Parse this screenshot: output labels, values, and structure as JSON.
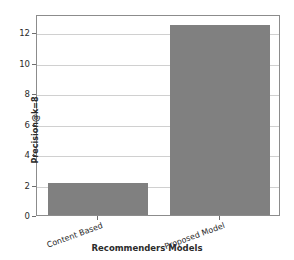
{
  "chart_data": {
    "type": "bar",
    "title": "",
    "xlabel": "Recommenders Models",
    "ylabel": "Precision@k=8",
    "categories": [
      "Content Based",
      "Proposed Model"
    ],
    "values": [
      2.1,
      12.5
    ],
    "series": [
      {
        "name": "Precision@k=8",
        "values": [
          2.1,
          12.5
        ],
        "color": "#808080"
      }
    ],
    "ylim": [
      0,
      13.2
    ],
    "yticks": [
      0,
      2,
      4,
      6,
      8,
      10,
      12
    ],
    "ytick_labels": [
      "0",
      "2",
      "4",
      "6",
      "8",
      "10",
      "12"
    ],
    "grid": "horizontal",
    "legend": "none",
    "bar_color": "#808080",
    "axis_color": "#8c8c8c",
    "grid_color": "#d0d0d0",
    "background": "#ffffff"
  }
}
